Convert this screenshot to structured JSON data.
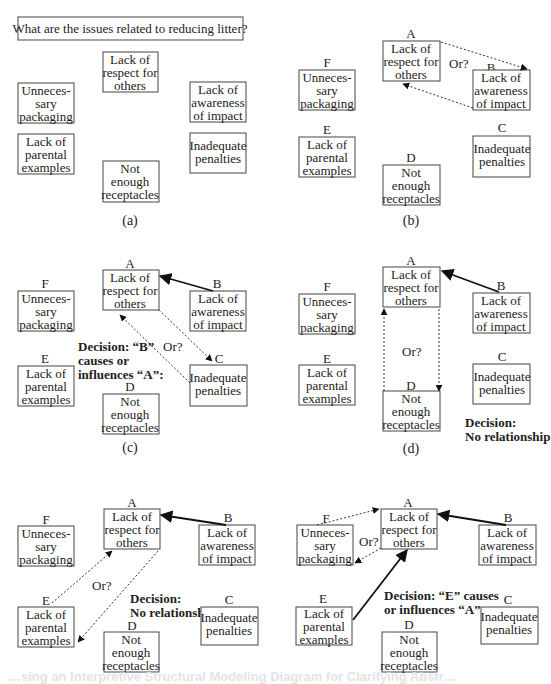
{
  "question": "What are the issues related to reducing litter?",
  "nodes": {
    "A": {
      "letter": "A",
      "lines": [
        "Lack of",
        "respect for",
        "others"
      ]
    },
    "B": {
      "letter": "B",
      "lines": [
        "Lack of",
        "awareness",
        "of impact"
      ]
    },
    "C": {
      "letter": "C",
      "lines": [
        "Inadequate",
        "penalties"
      ]
    },
    "D": {
      "letter": "D",
      "lines": [
        "Not",
        "enough",
        "receptacles"
      ]
    },
    "E": {
      "letter": "E",
      "lines": [
        "Lack of",
        "parental",
        "examples"
      ]
    },
    "F": {
      "letter": "F",
      "lines": [
        "Unneces-",
        "sary",
        "packaging"
      ]
    }
  },
  "panels": [
    {
      "id": "a",
      "caption": "(a)",
      "show_letters": false
    },
    {
      "id": "b",
      "caption": "(b)",
      "show_letters": true,
      "question_label": "Or?"
    },
    {
      "id": "c",
      "caption": "(c)",
      "show_letters": true,
      "question_label": "Or?",
      "decision_lines": [
        "Decision: “B”",
        "causes or",
        "influences “A”:"
      ]
    },
    {
      "id": "d",
      "caption": "(d)",
      "show_letters": true,
      "question_label": "Or?",
      "decision_lines": [
        "Decision:",
        "No relationship"
      ]
    },
    {
      "id": "e",
      "caption": "",
      "show_letters": true,
      "question_label": "Or?",
      "decision_lines": [
        "Decision:",
        "No relationship"
      ]
    },
    {
      "id": "f",
      "caption": "",
      "show_letters": true,
      "question_label": "Or?",
      "decision_lines": [
        "Decision: “E” causes",
        "or influences “A”"
      ]
    }
  ],
  "footer_caption": "…sing an Interpretive Structural Modeling Diagram for Clarifying Abstr…"
}
